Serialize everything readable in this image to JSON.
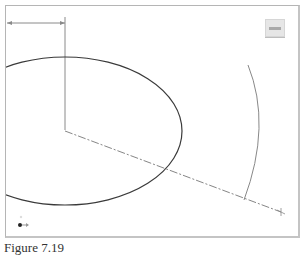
{
  "caption": "Figure 7.19",
  "viewport": {
    "name": "cad-drawing-viewport",
    "colors": {
      "frame": "#b5b5b5",
      "ellipse": "#3a3a3a",
      "dimension": "#8a8a8a",
      "arc": "#888888",
      "centerline": "#777777"
    }
  },
  "viewcube": {
    "label": "view-cube",
    "icon": "view-cube-icon"
  },
  "ucs_icon": {
    "label": "ucs-axis-icon"
  }
}
